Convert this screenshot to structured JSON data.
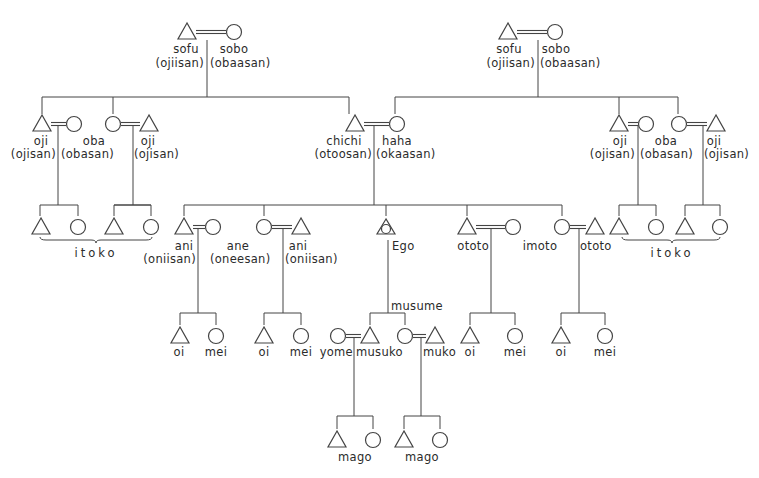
{
  "colors": {
    "ink": "#444444",
    "text": "#2b2b2b",
    "background": "#ffffff"
  },
  "diagram": {
    "symbols": [
      {
        "id": "pgf",
        "shape": "triangle",
        "x": 187,
        "y": 32
      },
      {
        "id": "pgm",
        "shape": "circle",
        "x": 234,
        "y": 32
      },
      {
        "id": "mgf",
        "shape": "triangle",
        "x": 508,
        "y": 32
      },
      {
        "id": "mgm",
        "shape": "circle",
        "x": 555,
        "y": 32
      },
      {
        "id": "lu1",
        "shape": "triangle",
        "x": 42,
        "y": 124
      },
      {
        "id": "lu1w",
        "shape": "circle",
        "x": 74,
        "y": 124
      },
      {
        "id": "la1",
        "shape": "circle",
        "x": 113,
        "y": 124
      },
      {
        "id": "la1h",
        "shape": "triangle",
        "x": 149,
        "y": 124
      },
      {
        "id": "father",
        "shape": "triangle",
        "x": 355,
        "y": 124
      },
      {
        "id": "mother",
        "shape": "circle",
        "x": 397,
        "y": 124
      },
      {
        "id": "ru1",
        "shape": "triangle",
        "x": 619,
        "y": 124
      },
      {
        "id": "ru1w",
        "shape": "circle",
        "x": 646,
        "y": 124
      },
      {
        "id": "ra1",
        "shape": "circle",
        "x": 679,
        "y": 124
      },
      {
        "id": "ra1h",
        "shape": "triangle",
        "x": 716,
        "y": 124
      },
      {
        "id": "c1",
        "shape": "triangle",
        "x": 41,
        "y": 227
      },
      {
        "id": "c2",
        "shape": "circle",
        "x": 78,
        "y": 227
      },
      {
        "id": "c3",
        "shape": "triangle",
        "x": 114,
        "y": 227
      },
      {
        "id": "c4",
        "shape": "circle",
        "x": 151,
        "y": 227
      },
      {
        "id": "ani1",
        "shape": "triangle",
        "x": 184,
        "y": 227
      },
      {
        "id": "ani1w",
        "shape": "circle",
        "x": 213,
        "y": 227
      },
      {
        "id": "ane",
        "shape": "circle",
        "x": 264,
        "y": 227
      },
      {
        "id": "aneh",
        "shape": "triangle",
        "x": 301,
        "y": 227
      },
      {
        "id": "ego",
        "shape": "ego",
        "x": 386,
        "y": 227
      },
      {
        "id": "ototo1",
        "shape": "triangle",
        "x": 467,
        "y": 227
      },
      {
        "id": "ototo1w",
        "shape": "circle",
        "x": 513,
        "y": 227
      },
      {
        "id": "imoto",
        "shape": "circle",
        "x": 562,
        "y": 227
      },
      {
        "id": "imotoh",
        "shape": "triangle",
        "x": 595,
        "y": 227
      },
      {
        "id": "c5",
        "shape": "triangle",
        "x": 619,
        "y": 227
      },
      {
        "id": "c6",
        "shape": "circle",
        "x": 656,
        "y": 227
      },
      {
        "id": "c7",
        "shape": "triangle",
        "x": 685,
        "y": 227
      },
      {
        "id": "c8",
        "shape": "circle",
        "x": 720,
        "y": 227
      },
      {
        "id": "n1",
        "shape": "triangle",
        "x": 180,
        "y": 336
      },
      {
        "id": "n2",
        "shape": "circle",
        "x": 216,
        "y": 336
      },
      {
        "id": "n3",
        "shape": "triangle",
        "x": 264,
        "y": 336
      },
      {
        "id": "n4",
        "shape": "circle",
        "x": 301,
        "y": 336
      },
      {
        "id": "yome",
        "shape": "circle",
        "x": 338,
        "y": 336
      },
      {
        "id": "musuko",
        "shape": "triangle",
        "x": 370,
        "y": 336
      },
      {
        "id": "musume",
        "shape": "circle",
        "x": 405,
        "y": 336
      },
      {
        "id": "muko",
        "shape": "triangle",
        "x": 435,
        "y": 336
      },
      {
        "id": "n5",
        "shape": "triangle",
        "x": 470,
        "y": 336
      },
      {
        "id": "n6",
        "shape": "circle",
        "x": 515,
        "y": 336
      },
      {
        "id": "n7",
        "shape": "triangle",
        "x": 561,
        "y": 336
      },
      {
        "id": "n8",
        "shape": "circle",
        "x": 605,
        "y": 336
      },
      {
        "id": "g1",
        "shape": "triangle",
        "x": 337,
        "y": 440
      },
      {
        "id": "g2",
        "shape": "circle",
        "x": 373,
        "y": 440
      },
      {
        "id": "g3",
        "shape": "triangle",
        "x": 404,
        "y": 440
      },
      {
        "id": "g4",
        "shape": "circle",
        "x": 440,
        "y": 440
      }
    ],
    "marriages": [
      {
        "x1": 196,
        "x2": 226,
        "y": 32,
        "double": true
      },
      {
        "x1": 517,
        "x2": 547,
        "y": 32,
        "double": true
      },
      {
        "x1": 51,
        "x2": 66,
        "y": 124,
        "double": true
      },
      {
        "x1": 121,
        "x2": 140,
        "y": 124,
        "double": true
      },
      {
        "x1": 364,
        "x2": 389,
        "y": 124,
        "double": true
      },
      {
        "x1": 628,
        "x2": 638,
        "y": 124,
        "double": true
      },
      {
        "x1": 687,
        "x2": 707,
        "y": 124,
        "double": true
      },
      {
        "x1": 193,
        "x2": 205,
        "y": 227,
        "double": true
      },
      {
        "x1": 272,
        "x2": 292,
        "y": 227,
        "double": true
      },
      {
        "x1": 476,
        "x2": 505,
        "y": 227,
        "double": true
      },
      {
        "x1": 570,
        "x2": 586,
        "y": 227,
        "double": true
      },
      {
        "x1": 346,
        "x2": 361,
        "y": 336,
        "double": true
      },
      {
        "x1": 413,
        "x2": 426,
        "y": 336,
        "double": true
      }
    ],
    "lines": [
      [
        207,
        40,
        207,
        97
      ],
      [
        42,
        97,
        349,
        97
      ],
      [
        42,
        97,
        42,
        114
      ],
      [
        113,
        97,
        113,
        114
      ],
      [
        349,
        97,
        349,
        114
      ],
      [
        538,
        40,
        538,
        97
      ],
      [
        395,
        97,
        678,
        97
      ],
      [
        395,
        97,
        395,
        114
      ],
      [
        619,
        97,
        619,
        114
      ],
      [
        678,
        97,
        678,
        114
      ],
      [
        58,
        125,
        58,
        205
      ],
      [
        40,
        205,
        78,
        205
      ],
      [
        40,
        205,
        40,
        216
      ],
      [
        78,
        205,
        78,
        216
      ],
      [
        133,
        125,
        133,
        205
      ],
      [
        114,
        205,
        151,
        205
      ],
      [
        114,
        205,
        151,
        205
      ],
      [
        114,
        205,
        114,
        216
      ],
      [
        151,
        205,
        151,
        216
      ],
      [
        374,
        125,
        374,
        205
      ],
      [
        184,
        205,
        562,
        205
      ],
      [
        184,
        205,
        184,
        216
      ],
      [
        264,
        205,
        264,
        216
      ],
      [
        386,
        205,
        386,
        216
      ],
      [
        467,
        205,
        467,
        216
      ],
      [
        562,
        205,
        562,
        216
      ],
      [
        638,
        125,
        638,
        205
      ],
      [
        619,
        205,
        656,
        205
      ],
      [
        619,
        205,
        619,
        216
      ],
      [
        656,
        205,
        656,
        216
      ],
      [
        703,
        125,
        703,
        205
      ],
      [
        685,
        205,
        720,
        205
      ],
      [
        685,
        205,
        685,
        216
      ],
      [
        720,
        205,
        720,
        216
      ],
      [
        198,
        228,
        198,
        313
      ],
      [
        180,
        313,
        216,
        313
      ],
      [
        180,
        313,
        180,
        325
      ],
      [
        216,
        313,
        216,
        325
      ],
      [
        283,
        228,
        283,
        313
      ],
      [
        264,
        313,
        301,
        313
      ],
      [
        264,
        313,
        264,
        325
      ],
      [
        301,
        313,
        301,
        325
      ],
      [
        388,
        240,
        388,
        313
      ],
      [
        370,
        313,
        405,
        313
      ],
      [
        370,
        313,
        370,
        325
      ],
      [
        405,
        313,
        405,
        325
      ],
      [
        491,
        228,
        491,
        313
      ],
      [
        470,
        313,
        515,
        313
      ],
      [
        470,
        313,
        470,
        325
      ],
      [
        515,
        313,
        515,
        325
      ],
      [
        579,
        228,
        579,
        313
      ],
      [
        561,
        313,
        605,
        313
      ],
      [
        561,
        313,
        561,
        325
      ],
      [
        605,
        313,
        605,
        325
      ],
      [
        354,
        337,
        354,
        416
      ],
      [
        337,
        416,
        373,
        416
      ],
      [
        337,
        416,
        337,
        429
      ],
      [
        373,
        416,
        373,
        429
      ],
      [
        421,
        337,
        421,
        416
      ],
      [
        404,
        416,
        440,
        416
      ],
      [
        404,
        416,
        404,
        429
      ],
      [
        440,
        416,
        440,
        429
      ]
    ],
    "braces": [
      {
        "x1": 40,
        "x2": 152,
        "y": 240,
        "mid": 96
      },
      {
        "x1": 622,
        "x2": 720,
        "y": 240,
        "mid": 672
      }
    ],
    "labels": [
      {
        "text": "sofu",
        "x": 186,
        "y": 43,
        "align": "c"
      },
      {
        "text": "(ojiisan)",
        "x": 204,
        "y": 57,
        "align": "r"
      },
      {
        "text": "sobo",
        "x": 234,
        "y": 43,
        "align": "c"
      },
      {
        "text": "(obaasan)",
        "x": 210,
        "y": 57,
        "align": "l"
      },
      {
        "text": "sofu",
        "x": 509,
        "y": 43,
        "align": "c"
      },
      {
        "text": "(ojiisan)",
        "x": 535,
        "y": 57,
        "align": "r"
      },
      {
        "text": "sobo",
        "x": 556,
        "y": 43,
        "align": "c"
      },
      {
        "text": "(obaasan)",
        "x": 540,
        "y": 57,
        "align": "l"
      },
      {
        "text": "oji",
        "x": 41,
        "y": 135,
        "align": "c"
      },
      {
        "text": "(ojisan)",
        "x": 56,
        "y": 148,
        "align": "r"
      },
      {
        "text": "oba",
        "x": 94,
        "y": 135,
        "align": "c"
      },
      {
        "text": "(obasan)",
        "x": 61,
        "y": 148,
        "align": "l"
      },
      {
        "text": "oji",
        "x": 148,
        "y": 135,
        "align": "c"
      },
      {
        "text": "(ojisan)",
        "x": 134,
        "y": 148,
        "align": "l"
      },
      {
        "text": "chichi",
        "x": 344,
        "y": 135,
        "align": "c"
      },
      {
        "text": "(otoosan)",
        "x": 372,
        "y": 148,
        "align": "r"
      },
      {
        "text": "haha",
        "x": 397,
        "y": 135,
        "align": "c"
      },
      {
        "text": "(okaasan)",
        "x": 376,
        "y": 148,
        "align": "l"
      },
      {
        "text": "oji",
        "x": 620,
        "y": 135,
        "align": "c"
      },
      {
        "text": "(ojisan)",
        "x": 635,
        "y": 148,
        "align": "r"
      },
      {
        "text": "oba",
        "x": 666,
        "y": 135,
        "align": "c"
      },
      {
        "text": "(obasan)",
        "x": 640,
        "y": 148,
        "align": "l"
      },
      {
        "text": "oji",
        "x": 714,
        "y": 135,
        "align": "c"
      },
      {
        "text": "(ojisan)",
        "x": 704,
        "y": 148,
        "align": "l"
      },
      {
        "text": "itoko",
        "x": 96,
        "y": 247,
        "align": "c"
      },
      {
        "text": "itoko",
        "x": 672,
        "y": 247,
        "align": "c"
      },
      {
        "text": "ani",
        "x": 184,
        "y": 240,
        "align": "c"
      },
      {
        "text": "(oniisan)",
        "x": 196,
        "y": 253,
        "align": "r"
      },
      {
        "text": "ane",
        "x": 238,
        "y": 240,
        "align": "c"
      },
      {
        "text": "(oneesan)",
        "x": 210,
        "y": 253,
        "align": "l"
      },
      {
        "text": "ani",
        "x": 298,
        "y": 240,
        "align": "c"
      },
      {
        "text": "(oniisan)",
        "x": 285,
        "y": 253,
        "align": "l"
      },
      {
        "text": "Ego",
        "x": 392,
        "y": 240,
        "align": "l"
      },
      {
        "text": "ototo",
        "x": 489,
        "y": 240,
        "align": "r"
      },
      {
        "text": "imoto",
        "x": 540,
        "y": 240,
        "align": "c"
      },
      {
        "text": "ototo",
        "x": 580,
        "y": 240,
        "align": "l"
      },
      {
        "text": "musume",
        "x": 391,
        "y": 300,
        "align": "l"
      },
      {
        "text": "oi",
        "x": 179,
        "y": 346,
        "align": "c"
      },
      {
        "text": "mei",
        "x": 216,
        "y": 346,
        "align": "c"
      },
      {
        "text": "oi",
        "x": 264,
        "y": 346,
        "align": "c"
      },
      {
        "text": "mei",
        "x": 301,
        "y": 346,
        "align": "c"
      },
      {
        "text": "yome",
        "x": 353,
        "y": 346,
        "align": "r"
      },
      {
        "text": "musuko",
        "x": 356,
        "y": 346,
        "align": "l"
      },
      {
        "text": "muko",
        "x": 423,
        "y": 346,
        "align": "l"
      },
      {
        "text": "oi",
        "x": 470,
        "y": 346,
        "align": "c"
      },
      {
        "text": "mei",
        "x": 515,
        "y": 346,
        "align": "c"
      },
      {
        "text": "oi",
        "x": 561,
        "y": 346,
        "align": "c"
      },
      {
        "text": "mei",
        "x": 605,
        "y": 346,
        "align": "c"
      },
      {
        "text": "mago",
        "x": 355,
        "y": 451,
        "align": "c"
      },
      {
        "text": "mago",
        "x": 422,
        "y": 451,
        "align": "c"
      }
    ]
  }
}
